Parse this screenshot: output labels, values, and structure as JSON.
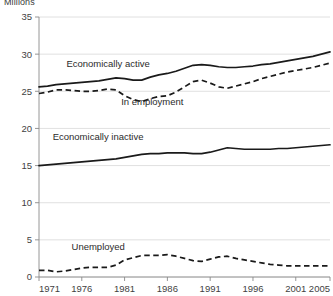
{
  "chart_data": {
    "type": "line",
    "title": "",
    "ylabel": "Millions",
    "xlabel": "",
    "ylim": [
      0,
      35
    ],
    "yticks": [
      0,
      5,
      10,
      15,
      20,
      25,
      30,
      35
    ],
    "xlim": [
      1971,
      2005
    ],
    "xticks": [
      1971,
      1976,
      1981,
      1986,
      1991,
      1996,
      2001,
      2005
    ],
    "xtick_labels": [
      "1971",
      "1976",
      "1981",
      "1986",
      "1991",
      "1996",
      "2001",
      "2005"
    ],
    "ytick_labels": [
      "0",
      "5",
      "10",
      "15",
      "20",
      "25",
      "30",
      "35"
    ],
    "grid": true,
    "legend_position": "inline-annotations",
    "x": [
      1971,
      1972,
      1973,
      1974,
      1975,
      1976,
      1977,
      1978,
      1979,
      1980,
      1981,
      1982,
      1983,
      1984,
      1985,
      1986,
      1987,
      1988,
      1989,
      1990,
      1991,
      1992,
      1993,
      1994,
      1995,
      1996,
      1997,
      1998,
      1999,
      2000,
      2001,
      2002,
      2003,
      2004,
      2005
    ],
    "series": [
      {
        "name": "Economically active",
        "style": "solid",
        "color": "#1a1a1a",
        "label_x": 1974.2,
        "label_y": 28.3,
        "values": [
          25.6,
          25.7,
          25.9,
          26.0,
          26.1,
          26.2,
          26.3,
          26.4,
          26.6,
          26.8,
          26.7,
          26.5,
          26.5,
          26.9,
          27.2,
          27.4,
          27.7,
          28.1,
          28.5,
          28.6,
          28.5,
          28.3,
          28.2,
          28.2,
          28.3,
          28.4,
          28.6,
          28.7,
          28.9,
          29.1,
          29.3,
          29.5,
          29.7,
          30.0,
          30.3
        ]
      },
      {
        "name": "In employment",
        "style": "dashed",
        "color": "#1a1a1a",
        "label_x": 1980.6,
        "label_y": 23.2,
        "values": [
          24.7,
          24.9,
          25.2,
          25.2,
          25.1,
          25.0,
          25.0,
          25.1,
          25.3,
          25.2,
          24.4,
          23.9,
          23.6,
          24.0,
          24.3,
          24.4,
          24.9,
          25.6,
          26.3,
          26.5,
          26.1,
          25.6,
          25.4,
          25.7,
          26.0,
          26.3,
          26.7,
          27.0,
          27.3,
          27.6,
          27.8,
          28.0,
          28.2,
          28.5,
          28.8
        ]
      },
      {
        "name": "Economically inactive",
        "style": "solid",
        "color": "#1a1a1a",
        "label_x": 1972.6,
        "label_y": 18.4,
        "values": [
          15.0,
          15.1,
          15.2,
          15.3,
          15.4,
          15.5,
          15.6,
          15.7,
          15.8,
          15.9,
          16.1,
          16.3,
          16.5,
          16.6,
          16.6,
          16.7,
          16.7,
          16.7,
          16.6,
          16.6,
          16.8,
          17.1,
          17.4,
          17.3,
          17.2,
          17.2,
          17.2,
          17.2,
          17.3,
          17.3,
          17.4,
          17.5,
          17.6,
          17.7,
          17.8
        ]
      },
      {
        "name": "Unemployed",
        "style": "dashed",
        "color": "#1a1a1a",
        "label_x": 1974.8,
        "label_y": 3.6,
        "values": [
          0.9,
          0.9,
          0.7,
          0.8,
          1.0,
          1.2,
          1.3,
          1.3,
          1.3,
          1.6,
          2.3,
          2.6,
          2.9,
          2.9,
          2.9,
          3.0,
          2.8,
          2.5,
          2.2,
          2.1,
          2.4,
          2.7,
          2.8,
          2.5,
          2.3,
          2.1,
          1.9,
          1.7,
          1.6,
          1.5,
          1.5,
          1.5,
          1.5,
          1.5,
          1.5
        ]
      }
    ]
  },
  "labels": {
    "y_axis_title": "Millions",
    "series_0": "Economically active",
    "series_1": "In employment",
    "series_2": "Economically inactive",
    "series_3": "Unemployed"
  }
}
